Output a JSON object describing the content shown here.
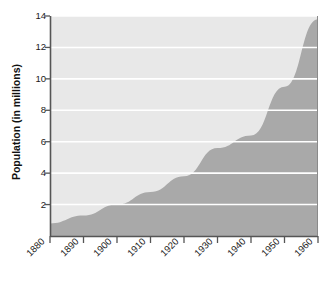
{
  "chart_data": {
    "type": "area",
    "title": "",
    "xlabel": "",
    "ylabel": "Population (in millions)",
    "grid": true,
    "legend_position": "none",
    "xlim": [
      1880,
      1960
    ],
    "ylim": [
      0,
      14
    ],
    "x_tick_labels": [
      "1880",
      "1890",
      "1900",
      "1910",
      "1920",
      "1930",
      "1940",
      "1950",
      "1960"
    ],
    "y_tick_labels": [
      "2",
      "4",
      "6",
      "8",
      "10",
      "12",
      "14"
    ],
    "y_tick_values": [
      2,
      4,
      6,
      8,
      10,
      12,
      14
    ],
    "x": [
      1880,
      1890,
      1900,
      1910,
      1920,
      1930,
      1940,
      1950,
      1960
    ],
    "values": [
      0.8,
      1.3,
      2.0,
      2.8,
      3.8,
      5.6,
      6.4,
      9.5,
      13.8
    ],
    "series": [
      {
        "name": "Population",
        "values": [
          0.8,
          1.3,
          2.0,
          2.8,
          3.8,
          5.6,
          6.4,
          9.5,
          13.8
        ]
      }
    ],
    "colors": {
      "area_fill": "#a9a9a9",
      "plot_background": "#e8e8e8",
      "gridline": "#ffffff",
      "axis_line": "#555555",
      "text": "#1a1a1a"
    }
  },
  "axes": {
    "y_title": "Population (in millions)"
  }
}
